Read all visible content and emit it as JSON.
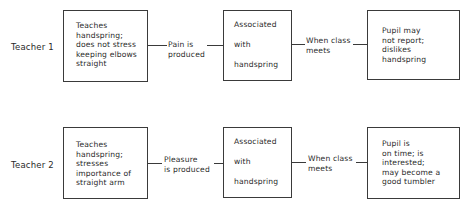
{
  "rows": [
    {
      "teacher": "Teacher 1",
      "box1": "Teaches\nhandspring;\ndoes not stress\nkeeping elbows\nstraight",
      "connector1": "Pain is\nproduced",
      "box2": "Associated\nwith\nhandspring",
      "connector2": "When class\nmeets",
      "box3": "Pupil may\nnot report;\ndislikes\nhandspring"
    },
    {
      "teacher": "Teacher 2",
      "box1": "Teaches\nhandspring;\nstresses\nimportance of\nstraight arm",
      "connector1": "Pleasure\nis produced",
      "box2": "Associated\nwith\nhandspring",
      "connector2": "When class\nmeets",
      "box3": "Pupil is\non time; is\ninterested;\nmay become a\ngood tumbler"
    }
  ]
}
